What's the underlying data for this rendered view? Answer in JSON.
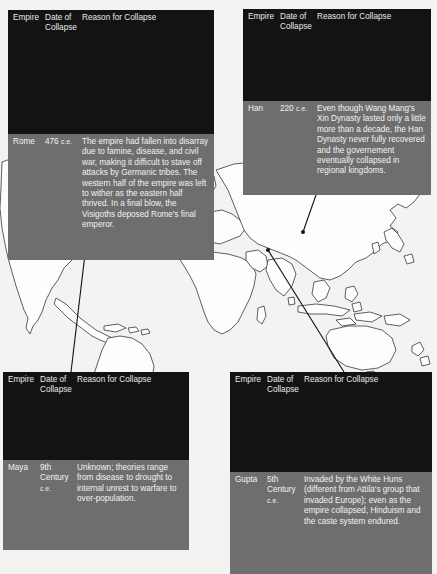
{
  "figure": {
    "type": "annotated-world-map",
    "background_color": "#f4f3f1",
    "map": {
      "name": "world-outline-map",
      "land_fill": "#fdfdfc",
      "land_stroke": "#2b2b2b"
    },
    "leader_line_color": "#111111"
  },
  "columns": {
    "empire": "Empire",
    "date": "Date of Collapse",
    "date_line1": "Date of",
    "date_line2": "Collapse",
    "reason": "Reason for Collapse"
  },
  "tables": [
    {
      "id": "rome",
      "name": "rome-collapse-table",
      "empire": "Rome",
      "date_value": "476",
      "date_era": "c.e.",
      "reason": "The empire had fallen into disarray due to famine, disease, and civil war, making it difficult to stave off attacks by Germanic tribes. The western half of the empire was left to wither as the eastern half thrived. In a final blow, the Visigoths deposed Rome's final emperor.",
      "marker_label": "Rome marker – Italy"
    },
    {
      "id": "han",
      "name": "han-collapse-table",
      "empire": "Han",
      "date_value": "220",
      "date_era": "c.e.",
      "reason": "Even though Wang Mang's Xin Dynasty lasted only a little more than a decade, the Han Dynasty never fully recovered and the governement eventually collapsed in regional kingdoms.",
      "marker_label": "Han marker – China"
    },
    {
      "id": "maya",
      "name": "maya-collapse-table",
      "empire": "Maya",
      "date_value": "9th Century",
      "date_era": "c.e.",
      "reason": "Unknown; theories range from disease to drought to internal unrest to warfare to over-population.",
      "marker_label": "Maya marker – Mesoamerica"
    },
    {
      "id": "gupta",
      "name": "gupta-collapse-table",
      "empire": "Gupta",
      "date_value": "5th Century",
      "date_era": "c.e.",
      "reason": "Invaded by the White Huns (different from Attila's group that invaded Europe); even as the empire collapsed, Hinduism and the caste system endured.",
      "marker_label": "Gupta marker – India"
    }
  ],
  "leaders": [
    {
      "id": "rome-leader",
      "from": [
        156,
        141
      ],
      "to": [
        199,
        226
      ],
      "dot_at": "to"
    },
    {
      "id": "han-leader",
      "from": [
        342,
        121
      ],
      "to": [
        303,
        232
      ],
      "dot_at": "to"
    },
    {
      "id": "maya-leader",
      "from": [
        71,
        372
      ],
      "to": [
        85,
        254
      ],
      "dot_at": "to"
    },
    {
      "id": "gupta-leader",
      "from": [
        344,
        372
      ],
      "to": [
        268,
        250
      ],
      "dot_at": "to"
    }
  ]
}
